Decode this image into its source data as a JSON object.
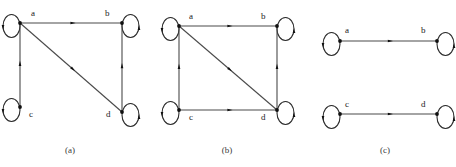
{
  "figure": {
    "title": "",
    "background_color": "#ffffff",
    "edge_color": "#4a4a4a",
    "loop_color": "#2b2b2b",
    "node_color": "#101010",
    "label_color": "#1a1a1a",
    "caption_color": "#3a3a3a"
  },
  "panels": [
    {
      "id": "a",
      "caption": "(a)",
      "caption_pos": {
        "x": 70,
        "y": 153
      },
      "nodes": [
        {
          "id": "a",
          "label": "a",
          "x": 20,
          "y": 23,
          "label_x": 31,
          "label_y": 16,
          "loop_side": "left"
        },
        {
          "id": "b",
          "label": "b",
          "x": 122,
          "y": 23,
          "label_x": 105,
          "label_y": 16,
          "loop_side": "right"
        },
        {
          "id": "c",
          "label": "c",
          "x": 20,
          "y": 107,
          "label_x": 29,
          "label_y": 117,
          "loop_side": "left"
        },
        {
          "id": "d",
          "label": "d",
          "x": 122,
          "y": 112,
          "label_x": 106,
          "label_y": 117,
          "loop_side": "right"
        }
      ],
      "edges": [
        {
          "from": "a",
          "to": "b",
          "kind": "straight"
        },
        {
          "from": "a",
          "to": "d",
          "kind": "straight"
        },
        {
          "from": "c",
          "to": "a",
          "kind": "straight"
        },
        {
          "from": "d",
          "to": "b",
          "kind": "straight"
        }
      ],
      "self_loops": [
        "a",
        "b",
        "c",
        "d"
      ]
    },
    {
      "id": "b",
      "caption": "(b)",
      "caption_pos": {
        "x": 227,
        "y": 153
      },
      "nodes": [
        {
          "id": "a",
          "label": "a",
          "x": 179,
          "y": 26,
          "label_x": 189,
          "label_y": 19,
          "loop_side": "left"
        },
        {
          "id": "b",
          "label": "b",
          "x": 277,
          "y": 26,
          "label_x": 261,
          "label_y": 19,
          "loop_side": "right"
        },
        {
          "id": "c",
          "label": "c",
          "x": 179,
          "y": 110,
          "label_x": 189,
          "label_y": 120,
          "loop_side": "left"
        },
        {
          "id": "d",
          "label": "d",
          "x": 277,
          "y": 110,
          "label_x": 261,
          "label_y": 120,
          "loop_side": "right"
        }
      ],
      "edges": [
        {
          "from": "a",
          "to": "b",
          "kind": "straight"
        },
        {
          "from": "a",
          "to": "d",
          "kind": "straight"
        },
        {
          "from": "c",
          "to": "a",
          "kind": "straight"
        },
        {
          "from": "c",
          "to": "d",
          "kind": "straight"
        },
        {
          "from": "d",
          "to": "b",
          "kind": "straight"
        }
      ],
      "self_loops": [
        "a",
        "b",
        "c",
        "d"
      ]
    },
    {
      "id": "c",
      "caption": "(c)",
      "caption_pos": {
        "x": 385,
        "y": 153
      },
      "nodes": [
        {
          "id": "a",
          "label": "a",
          "x": 340,
          "y": 41,
          "label_x": 345,
          "label_y": 33,
          "loop_side": "left"
        },
        {
          "id": "b",
          "label": "b",
          "x": 437,
          "y": 41,
          "label_x": 421,
          "label_y": 33,
          "loop_side": "right"
        },
        {
          "id": "c",
          "label": "c",
          "x": 340,
          "y": 114,
          "label_x": 345,
          "label_y": 107,
          "loop_side": "left"
        },
        {
          "id": "d",
          "label": "d",
          "x": 437,
          "y": 114,
          "label_x": 421,
          "label_y": 107,
          "loop_side": "right"
        }
      ],
      "edges": [
        {
          "from": "a",
          "to": "b",
          "kind": "straight"
        },
        {
          "from": "c",
          "to": "d",
          "kind": "straight"
        }
      ],
      "self_loops": [
        "a",
        "b",
        "c",
        "d"
      ]
    }
  ]
}
